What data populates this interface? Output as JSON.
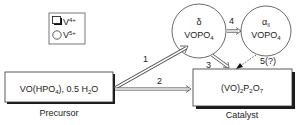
{
  "legend": {
    "v4_label": "V",
    "v4_sup": "4+",
    "v5_label": "V",
    "v5_sup": "5+"
  },
  "nodes": {
    "precursor": {
      "formula_a": "VO(HPO",
      "formula_sub1": "4",
      "formula_b": "), 0.5 H",
      "formula_sub2": "2",
      "formula_c": "O",
      "caption": "Precursor"
    },
    "catalyst": {
      "formula_a": "(VO)",
      "sub1": "2",
      "formula_b": "P",
      "sub2": "2",
      "formula_c": "O",
      "sub3": "7",
      "caption": "Catalyst"
    },
    "delta": {
      "greek": "δ",
      "formula": "VOPO",
      "sub": "4"
    },
    "alpha": {
      "greek": "α",
      "greek_sub": "II",
      "formula": "VOPO",
      "sub": "4"
    }
  },
  "edges": [
    {
      "id": "1",
      "label": "1",
      "from": "precursor",
      "to": "delta",
      "style": "double"
    },
    {
      "id": "2",
      "label": "2",
      "from": "precursor",
      "to": "catalyst",
      "style": "double"
    },
    {
      "id": "3",
      "label": "3",
      "from": "delta",
      "to": "catalyst",
      "style": "double"
    },
    {
      "id": "4",
      "label": "4",
      "from": "delta",
      "to": "alpha",
      "style": "double"
    },
    {
      "id": "5",
      "label": "5(?)",
      "from": "alpha",
      "to": "catalyst",
      "style": "dotted"
    }
  ]
}
